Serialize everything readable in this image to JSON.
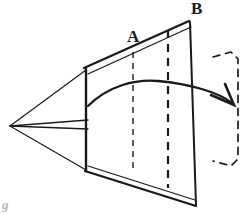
{
  "figure": {
    "background_color": "#ffffff",
    "ink_color": "#1a1a1a",
    "width": 246,
    "height": 214
  },
  "labels": {
    "vertex_a": "A",
    "vertex_b": "B",
    "corner_note": "g"
  },
  "geometry": {
    "apex": {
      "x": 10,
      "y": 126
    },
    "top_front_corner": {
      "x": 86,
      "y": 70
    },
    "bottom_front_corner": {
      "x": 86,
      "y": 170
    },
    "top_back_corner": {
      "x": 190,
      "y": 22
    },
    "bottom_back_corner": {
      "x": 196,
      "y": 205
    },
    "front_face_left_edge": {
      "x": 86,
      "y_top": 70,
      "y_bottom": 170
    },
    "back_face_right_edge": {
      "x_top": 190,
      "y_top": 22,
      "x_bottom": 196,
      "y_bottom": 205
    }
  },
  "hidden_lines": {
    "description": "dashed vertical construction lines inside the body",
    "lines": [
      {
        "name": "dashed-line-a",
        "x": 133,
        "y_top": 52,
        "y_bottom": 172,
        "dash": "6 5",
        "width": 1.4
      },
      {
        "name": "dashed-line-b",
        "x": 168,
        "y_top": 30,
        "y_bottom": 188,
        "dash": "8 6",
        "width": 2.2
      }
    ]
  },
  "rotation_arrow": {
    "description": "curved arrow sweeping left to right indicating rotation direction",
    "start": {
      "x": 88,
      "y": 106
    },
    "peak": {
      "x": 155,
      "y": 81
    },
    "end": {
      "x": 233,
      "y": 104
    },
    "arrowhead_angle_deg": 48
  },
  "dashed_bracket": {
    "description": "dashed outline of the rotated position of the back face",
    "points": "214,56 232,52 238,58 238,160 232,166 214,162",
    "dash": "7 6"
  },
  "colors": {
    "ink": "#1a1a1a",
    "background": "#ffffff",
    "faint_note": "#9a9a9a"
  }
}
